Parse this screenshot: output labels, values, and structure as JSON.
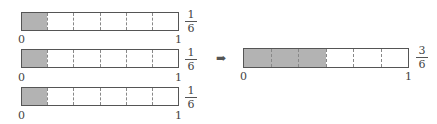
{
  "left_bars": [
    {
      "parts": 6,
      "shaded": 1,
      "start_label": "0",
      "end_label": "1",
      "fraction": {
        "numerator": "1",
        "denominator": "6"
      }
    },
    {
      "parts": 6,
      "shaded": 1,
      "start_label": "0",
      "end_label": "1",
      "fraction": {
        "numerator": "1",
        "denominator": "6"
      }
    },
    {
      "parts": 6,
      "shaded": 1,
      "start_label": "0",
      "end_label": "1",
      "fraction": {
        "numerator": "1",
        "denominator": "6"
      }
    }
  ],
  "arrow": {
    "icon": "right-arrow-icon",
    "glyph": "➡"
  },
  "result_bar": {
    "parts": 6,
    "shaded": 3,
    "start_label": "0",
    "end_label": "1",
    "fraction": {
      "numerator": "3",
      "denominator": "6"
    }
  },
  "colors": {
    "shaded": "#b3b3b3",
    "border": "#555555",
    "divider": "#888888"
  }
}
